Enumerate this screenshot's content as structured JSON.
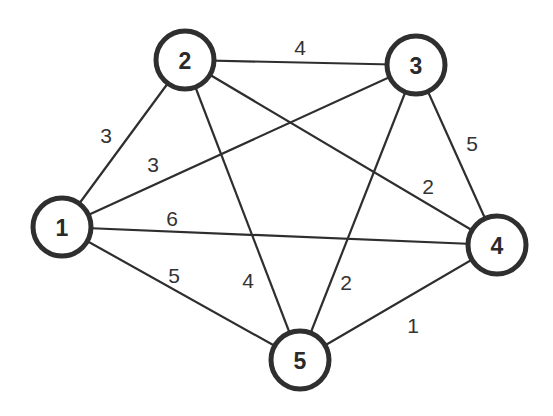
{
  "diagram": {
    "type": "weighted-undirected-graph",
    "nodes": [
      {
        "id": "1",
        "label": "1",
        "x": 62,
        "y": 227
      },
      {
        "id": "2",
        "label": "2",
        "x": 185,
        "y": 60
      },
      {
        "id": "3",
        "label": "3",
        "x": 416,
        "y": 65
      },
      {
        "id": "4",
        "label": "4",
        "x": 497,
        "y": 245
      },
      {
        "id": "5",
        "label": "5",
        "x": 300,
        "y": 360
      }
    ],
    "edges": [
      {
        "from": "1",
        "to": "2",
        "weight": "3",
        "lx": 106,
        "ly": 135
      },
      {
        "from": "1",
        "to": "3",
        "weight": "3",
        "lx": 153,
        "ly": 164
      },
      {
        "from": "1",
        "to": "4",
        "weight": "6",
        "lx": 172,
        "ly": 218
      },
      {
        "from": "1",
        "to": "5",
        "weight": "5",
        "lx": 174,
        "ly": 275
      },
      {
        "from": "2",
        "to": "3",
        "weight": "4",
        "lx": 300,
        "ly": 47
      },
      {
        "from": "2",
        "to": "4",
        "weight": "2",
        "lx": 428,
        "ly": 186
      },
      {
        "from": "2",
        "to": "5",
        "weight": "4",
        "lx": 248,
        "ly": 280
      },
      {
        "from": "3",
        "to": "4",
        "weight": "5",
        "lx": 472,
        "ly": 143
      },
      {
        "from": "3",
        "to": "5",
        "weight": "2",
        "lx": 346,
        "ly": 282
      },
      {
        "from": "4",
        "to": "5",
        "weight": "1",
        "lx": 413,
        "ly": 325
      }
    ]
  }
}
